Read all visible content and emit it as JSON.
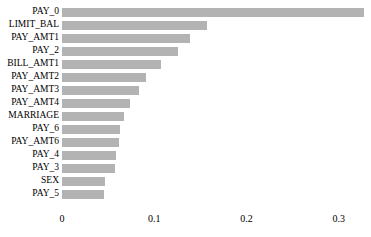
{
  "chart_data": {
    "type": "bar",
    "orientation": "horizontal",
    "title": "",
    "subtitle": "",
    "xlabel": "",
    "ylabel": "",
    "grid": false,
    "legend": null,
    "xlim": [
      0,
      0.335
    ],
    "xticks": [
      "0",
      "0.1",
      "0.2",
      "0.3"
    ],
    "xtick_values": [
      0,
      0.1,
      0.2,
      0.3
    ],
    "bar_color": "#b3b3b3",
    "background_color": "#ffffff",
    "categories": [
      "PAY_0",
      "LIMIT_BAL",
      "PAY_AMT1",
      "PAY_2",
      "BILL_AMT1",
      "PAY_AMT2",
      "PAY_AMT3",
      "PAY_AMT4",
      "MARRIAGE",
      "PAY_6",
      "PAY_AMT6",
      "PAY_4",
      "PAY_3",
      "SEX",
      "PAY_5"
    ],
    "values": [
      0.327,
      0.157,
      0.139,
      0.126,
      0.107,
      0.091,
      0.084,
      0.074,
      0.067,
      0.063,
      0.062,
      0.059,
      0.057,
      0.047,
      0.046
    ]
  }
}
